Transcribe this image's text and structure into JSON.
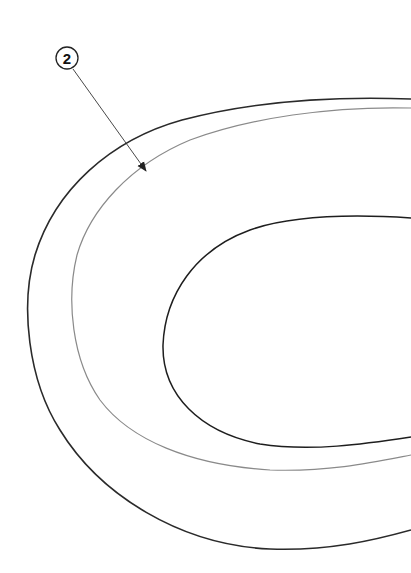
{
  "figure": {
    "type": "patent-line-drawing",
    "background": "#ffffff",
    "stroke_color": "#2a2a2a",
    "light_stroke_color": "#8a8a8a"
  },
  "reference_labels": [
    {
      "id": "2",
      "text": "2",
      "circle_center": [
        67,
        58
      ],
      "circle_radius": 11,
      "arrow_from": [
        73,
        69
      ],
      "arrow_to": [
        146,
        171
      ]
    }
  ],
  "curves": [
    {
      "name": "outer",
      "description": "outermost contour"
    },
    {
      "name": "middle",
      "description": "middle contour (indicated by reference 2)"
    },
    {
      "name": "inner",
      "description": "inner contour"
    }
  ]
}
